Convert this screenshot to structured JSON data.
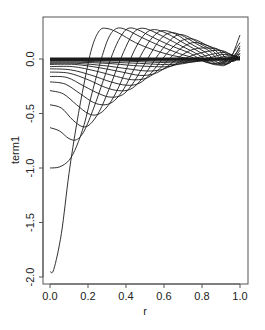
{
  "chart_data": {
    "type": "line",
    "title": "",
    "xlabel": "r",
    "ylabel": "term1",
    "xlim": [
      -0.04,
      1.04
    ],
    "ylim": [
      -2.05,
      0.33
    ],
    "grid": false,
    "legend": null,
    "x_ticks": [
      0.0,
      0.2,
      0.4,
      0.6,
      0.8,
      1.0
    ],
    "x_tick_labels": [
      "0.0",
      "0.2",
      "0.4",
      "0.6",
      "0.8",
      "1.0"
    ],
    "y_ticks": [
      0.0,
      -0.5,
      -1.0,
      -1.5,
      -2.0
    ],
    "y_tick_labels": [
      "0.0",
      "-0.5",
      "-1.0",
      "-1.5",
      "-2.0"
    ],
    "line_color": "#1a1a1a",
    "series": [
      {
        "name": "curve-1",
        "points": [
          [
            0.0,
            -1.95
          ],
          [
            0.02,
            -1.93
          ],
          [
            0.06,
            -1.6
          ],
          [
            0.1,
            -1.05
          ],
          [
            0.14,
            -0.6
          ],
          [
            0.18,
            -0.22
          ],
          [
            0.22,
            0.1
          ],
          [
            0.26,
            0.26
          ],
          [
            0.3,
            0.28
          ],
          [
            0.36,
            0.24
          ],
          [
            0.45,
            0.15
          ],
          [
            0.55,
            0.08
          ],
          [
            0.65,
            0.03
          ],
          [
            0.75,
            0.0
          ],
          [
            0.85,
            -0.02
          ],
          [
            0.93,
            0.0
          ],
          [
            1.0,
            0.02
          ]
        ]
      },
      {
        "name": "curve-2",
        "points": [
          [
            0.0,
            -1.0
          ],
          [
            0.05,
            -0.99
          ],
          [
            0.1,
            -0.93
          ],
          [
            0.14,
            -0.8
          ],
          [
            0.18,
            -0.6
          ],
          [
            0.22,
            -0.32
          ],
          [
            0.27,
            0.0
          ],
          [
            0.31,
            0.2
          ],
          [
            0.35,
            0.28
          ],
          [
            0.4,
            0.27
          ],
          [
            0.48,
            0.2
          ],
          [
            0.58,
            0.12
          ],
          [
            0.68,
            0.05
          ],
          [
            0.78,
            0.0
          ],
          [
            0.86,
            -0.04
          ],
          [
            0.94,
            0.0
          ],
          [
            1.0,
            0.05
          ]
        ]
      },
      {
        "name": "curve-3",
        "points": [
          [
            0.0,
            -0.63
          ],
          [
            0.05,
            -0.66
          ],
          [
            0.1,
            -0.73
          ],
          [
            0.14,
            -0.74
          ],
          [
            0.18,
            -0.66
          ],
          [
            0.23,
            -0.45
          ],
          [
            0.28,
            -0.2
          ],
          [
            0.33,
            0.05
          ],
          [
            0.37,
            0.2
          ],
          [
            0.41,
            0.28
          ],
          [
            0.46,
            0.27
          ],
          [
            0.54,
            0.2
          ],
          [
            0.64,
            0.12
          ],
          [
            0.74,
            0.05
          ],
          [
            0.82,
            -0.03
          ],
          [
            0.9,
            -0.04
          ],
          [
            0.96,
            0.02
          ],
          [
            1.0,
            0.1
          ]
        ]
      },
      {
        "name": "curve-4",
        "points": [
          [
            0.0,
            -0.42
          ],
          [
            0.06,
            -0.45
          ],
          [
            0.12,
            -0.56
          ],
          [
            0.17,
            -0.62
          ],
          [
            0.21,
            -0.6
          ],
          [
            0.26,
            -0.48
          ],
          [
            0.31,
            -0.28
          ],
          [
            0.36,
            -0.05
          ],
          [
            0.41,
            0.15
          ],
          [
            0.45,
            0.26
          ],
          [
            0.5,
            0.28
          ],
          [
            0.58,
            0.22
          ],
          [
            0.68,
            0.13
          ],
          [
            0.78,
            0.04
          ],
          [
            0.86,
            -0.05
          ],
          [
            0.93,
            -0.02
          ],
          [
            1.0,
            0.15
          ]
        ]
      },
      {
        "name": "curve-5",
        "points": [
          [
            0.0,
            -0.29
          ],
          [
            0.07,
            -0.32
          ],
          [
            0.14,
            -0.42
          ],
          [
            0.2,
            -0.5
          ],
          [
            0.25,
            -0.51
          ],
          [
            0.3,
            -0.44
          ],
          [
            0.35,
            -0.3
          ],
          [
            0.4,
            -0.1
          ],
          [
            0.45,
            0.1
          ],
          [
            0.5,
            0.23
          ],
          [
            0.55,
            0.27
          ],
          [
            0.62,
            0.23
          ],
          [
            0.71,
            0.14
          ],
          [
            0.8,
            0.05
          ],
          [
            0.88,
            -0.05
          ],
          [
            0.94,
            -0.03
          ],
          [
            1.0,
            0.22
          ]
        ]
      },
      {
        "name": "curve-6",
        "points": [
          [
            0.0,
            -0.21
          ],
          [
            0.08,
            -0.23
          ],
          [
            0.16,
            -0.32
          ],
          [
            0.23,
            -0.4
          ],
          [
            0.29,
            -0.42
          ],
          [
            0.34,
            -0.38
          ],
          [
            0.39,
            -0.27
          ],
          [
            0.44,
            -0.1
          ],
          [
            0.49,
            0.07
          ],
          [
            0.54,
            0.2
          ],
          [
            0.59,
            0.26
          ],
          [
            0.66,
            0.23
          ],
          [
            0.74,
            0.14
          ],
          [
            0.82,
            0.06
          ],
          [
            0.89,
            -0.04
          ],
          [
            0.95,
            -0.03
          ],
          [
            1.0,
            0.12
          ]
        ]
      },
      {
        "name": "curve-7",
        "points": [
          [
            0.0,
            -0.16
          ],
          [
            0.09,
            -0.17
          ],
          [
            0.18,
            -0.25
          ],
          [
            0.26,
            -0.32
          ],
          [
            0.32,
            -0.35
          ],
          [
            0.38,
            -0.33
          ],
          [
            0.43,
            -0.24
          ],
          [
            0.48,
            -0.1
          ],
          [
            0.53,
            0.05
          ],
          [
            0.58,
            0.18
          ],
          [
            0.63,
            0.24
          ],
          [
            0.69,
            0.22
          ],
          [
            0.77,
            0.14
          ],
          [
            0.84,
            0.07
          ],
          [
            0.9,
            -0.03
          ],
          [
            0.95,
            -0.03
          ],
          [
            1.0,
            0.08
          ]
        ]
      },
      {
        "name": "curve-8",
        "points": [
          [
            0.0,
            -0.12
          ],
          [
            0.1,
            -0.13
          ],
          [
            0.2,
            -0.19
          ],
          [
            0.29,
            -0.26
          ],
          [
            0.36,
            -0.29
          ],
          [
            0.42,
            -0.28
          ],
          [
            0.47,
            -0.21
          ],
          [
            0.52,
            -0.09
          ],
          [
            0.57,
            0.04
          ],
          [
            0.62,
            0.15
          ],
          [
            0.67,
            0.22
          ],
          [
            0.72,
            0.21
          ],
          [
            0.79,
            0.14
          ],
          [
            0.86,
            0.07
          ],
          [
            0.91,
            -0.02
          ],
          [
            0.96,
            -0.02
          ],
          [
            1.0,
            0.05
          ]
        ]
      },
      {
        "name": "curve-9",
        "points": [
          [
            0.0,
            -0.09
          ],
          [
            0.11,
            -0.1
          ],
          [
            0.22,
            -0.15
          ],
          [
            0.32,
            -0.21
          ],
          [
            0.4,
            -0.24
          ],
          [
            0.46,
            -0.23
          ],
          [
            0.51,
            -0.17
          ],
          [
            0.56,
            -0.07
          ],
          [
            0.61,
            0.04
          ],
          [
            0.66,
            0.13
          ],
          [
            0.71,
            0.18
          ],
          [
            0.76,
            0.18
          ],
          [
            0.82,
            0.13
          ],
          [
            0.87,
            0.08
          ],
          [
            0.92,
            -0.01
          ],
          [
            0.97,
            -0.02
          ],
          [
            1.0,
            0.03
          ]
        ]
      },
      {
        "name": "curve-10",
        "points": [
          [
            0.0,
            -0.07
          ],
          [
            0.12,
            -0.07
          ],
          [
            0.24,
            -0.11
          ],
          [
            0.35,
            -0.16
          ],
          [
            0.43,
            -0.19
          ],
          [
            0.5,
            -0.18
          ],
          [
            0.55,
            -0.13
          ],
          [
            0.6,
            -0.05
          ],
          [
            0.65,
            0.04
          ],
          [
            0.7,
            0.11
          ],
          [
            0.75,
            0.15
          ],
          [
            0.8,
            0.14
          ],
          [
            0.85,
            0.11
          ],
          [
            0.89,
            0.08
          ],
          [
            0.93,
            0.0
          ],
          [
            0.97,
            -0.01
          ],
          [
            1.0,
            0.02
          ]
        ]
      },
      {
        "name": "curve-11",
        "points": [
          [
            0.0,
            -0.05
          ],
          [
            0.13,
            -0.05
          ],
          [
            0.26,
            -0.08
          ],
          [
            0.38,
            -0.12
          ],
          [
            0.47,
            -0.15
          ],
          [
            0.54,
            -0.14
          ],
          [
            0.59,
            -0.1
          ],
          [
            0.64,
            -0.04
          ],
          [
            0.69,
            0.03
          ],
          [
            0.74,
            0.08
          ],
          [
            0.79,
            0.1
          ],
          [
            0.84,
            0.1
          ],
          [
            0.88,
            0.09
          ],
          [
            0.92,
            0.06
          ],
          [
            0.95,
            0.01
          ],
          [
            0.98,
            0.0
          ],
          [
            1.0,
            0.02
          ]
        ]
      },
      {
        "name": "curve-12",
        "points": [
          [
            0.0,
            -0.04
          ],
          [
            0.14,
            -0.04
          ],
          [
            0.28,
            -0.06
          ],
          [
            0.41,
            -0.09
          ],
          [
            0.51,
            -0.11
          ],
          [
            0.58,
            -0.1
          ],
          [
            0.63,
            -0.07
          ],
          [
            0.68,
            -0.03
          ],
          [
            0.73,
            0.02
          ],
          [
            0.78,
            0.05
          ],
          [
            0.83,
            0.07
          ],
          [
            0.88,
            0.08
          ],
          [
            0.92,
            0.07
          ],
          [
            0.95,
            0.04
          ],
          [
            0.98,
            0.01
          ],
          [
            1.0,
            0.01
          ]
        ]
      },
      {
        "name": "curve-13",
        "points": [
          [
            0.0,
            -0.03
          ],
          [
            0.15,
            -0.03
          ],
          [
            0.3,
            -0.04
          ],
          [
            0.44,
            -0.06
          ],
          [
            0.55,
            -0.07
          ],
          [
            0.62,
            -0.07
          ],
          [
            0.67,
            -0.05
          ],
          [
            0.72,
            -0.02
          ],
          [
            0.77,
            0.01
          ],
          [
            0.82,
            0.03
          ],
          [
            0.87,
            0.05
          ],
          [
            0.91,
            0.06
          ],
          [
            0.94,
            0.05
          ],
          [
            0.97,
            0.03
          ],
          [
            1.0,
            0.01
          ]
        ]
      },
      {
        "name": "curve-14",
        "points": [
          [
            0.0,
            -0.02
          ],
          [
            0.16,
            -0.02
          ],
          [
            0.32,
            -0.03
          ],
          [
            0.47,
            -0.04
          ],
          [
            0.58,
            -0.05
          ],
          [
            0.66,
            -0.05
          ],
          [
            0.71,
            -0.04
          ],
          [
            0.76,
            -0.02
          ],
          [
            0.81,
            0.0
          ],
          [
            0.86,
            0.02
          ],
          [
            0.9,
            0.04
          ],
          [
            0.94,
            0.04
          ],
          [
            0.97,
            0.03
          ],
          [
            1.0,
            0.01
          ]
        ]
      },
      {
        "name": "curve-15",
        "points": [
          [
            0.0,
            -0.015
          ],
          [
            0.2,
            -0.015
          ],
          [
            0.4,
            -0.02
          ],
          [
            0.55,
            -0.03
          ],
          [
            0.66,
            -0.035
          ],
          [
            0.74,
            -0.03
          ],
          [
            0.8,
            -0.015
          ],
          [
            0.86,
            0.0
          ],
          [
            0.91,
            0.02
          ],
          [
            0.95,
            0.03
          ],
          [
            0.98,
            0.02
          ],
          [
            1.0,
            0.01
          ]
        ]
      },
      {
        "name": "curve-16",
        "points": [
          [
            0.0,
            -0.01
          ],
          [
            0.2,
            -0.01
          ],
          [
            0.4,
            -0.012
          ],
          [
            0.6,
            -0.02
          ],
          [
            0.72,
            -0.022
          ],
          [
            0.8,
            -0.018
          ],
          [
            0.86,
            -0.008
          ],
          [
            0.91,
            0.005
          ],
          [
            0.95,
            0.015
          ],
          [
            0.98,
            0.015
          ],
          [
            1.0,
            0.01
          ]
        ]
      },
      {
        "name": "curve-17",
        "points": [
          [
            0.0,
            -0.006
          ],
          [
            0.3,
            -0.006
          ],
          [
            0.6,
            -0.01
          ],
          [
            0.75,
            -0.012
          ],
          [
            0.85,
            -0.008
          ],
          [
            0.92,
            0.0
          ],
          [
            0.96,
            0.008
          ],
          [
            1.0,
            0.005
          ]
        ]
      },
      {
        "name": "curve-18",
        "points": [
          [
            0.0,
            -0.003
          ],
          [
            0.3,
            -0.003
          ],
          [
            0.6,
            -0.005
          ],
          [
            0.8,
            -0.006
          ],
          [
            0.9,
            -0.003
          ],
          [
            0.96,
            0.003
          ],
          [
            1.0,
            0.003
          ]
        ]
      },
      {
        "name": "curve-19",
        "points": [
          [
            0.0,
            0.0
          ],
          [
            0.5,
            0.0
          ],
          [
            0.85,
            -0.002
          ],
          [
            0.95,
            0.001
          ],
          [
            1.0,
            0.001
          ]
        ]
      }
    ]
  }
}
